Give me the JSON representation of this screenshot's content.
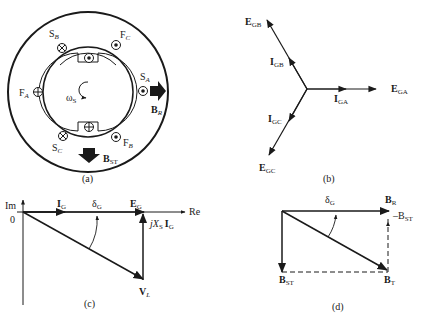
{
  "figure": {
    "panels": [
      {
        "id": "a",
        "caption": "(a)",
        "description": "Cross-section of synchronous generator with stator and rotor windings",
        "labels": {
          "sb": {
            "main": "S",
            "sub": "B"
          },
          "fc": {
            "main": "F",
            "sub": "C"
          },
          "sa": {
            "main": "S",
            "sub": "A"
          },
          "fa": {
            "main": "F",
            "sub": "A"
          },
          "sc": {
            "main": "S",
            "sub": "C"
          },
          "fb": {
            "main": "F",
            "sub": "B"
          },
          "br": {
            "main": "B",
            "sub": "R"
          },
          "bst": {
            "main": "B",
            "sub": "ST"
          },
          "omega": {
            "main": "ω",
            "sub": "S"
          }
        }
      },
      {
        "id": "b",
        "caption": "(b)",
        "description": "Three-phase phasor diagram of internal voltages and currents",
        "labels": {
          "egb": {
            "main": "E",
            "sub": "GB"
          },
          "igb": {
            "main": "I",
            "sub": "GB"
          },
          "ega": {
            "main": "E",
            "sub": "GA"
          },
          "iga": {
            "main": "I",
            "sub": "GA"
          },
          "igc": {
            "main": "I",
            "sub": "GC"
          },
          "egc": {
            "main": "E",
            "sub": "GC"
          }
        }
      },
      {
        "id": "c",
        "caption": "(c)",
        "description": "Voltage phasor diagram of generator",
        "labels": {
          "im": "Im",
          "re": "Re",
          "origin": "0",
          "ig": {
            "main": "I",
            "sub": "G"
          },
          "delta": {
            "main": "δ",
            "sub": "G"
          },
          "eg": {
            "main": "E",
            "sub": "G"
          },
          "jxs": {
            "prefix": "jX",
            "sub": "S",
            "suffix": "I",
            "suffix_sub": "G"
          },
          "vl": {
            "main": "V",
            "sub": "L"
          }
        }
      },
      {
        "id": "d",
        "caption": "(d)",
        "description": "Magnetic field diagram",
        "labels": {
          "delta": {
            "main": "δ",
            "sub": "G"
          },
          "br": {
            "main": "B",
            "sub": "R"
          },
          "bst_right": {
            "main": "–B",
            "sub": "ST"
          },
          "bst": {
            "main": "B",
            "sub": "ST"
          },
          "bt": {
            "main": "B",
            "sub": "T"
          }
        }
      }
    ]
  }
}
